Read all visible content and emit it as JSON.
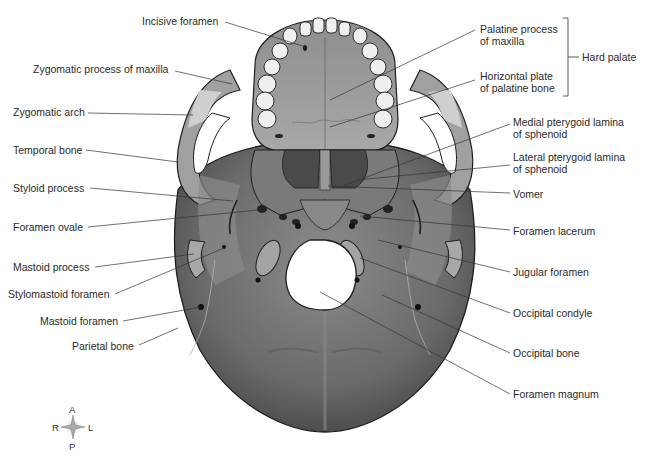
{
  "figure": {
    "view": "inferior"
  },
  "labels_left": [
    {
      "id": "incisive-foramen",
      "text": "Incisive foramen"
    },
    {
      "id": "zygomatic-process-of-maxilla",
      "text": "Zygomatic process of maxilla"
    },
    {
      "id": "zygomatic-arch",
      "text": "Zygomatic arch"
    },
    {
      "id": "temporal-bone",
      "text": "Temporal bone"
    },
    {
      "id": "styloid-process",
      "text": "Styloid process"
    },
    {
      "id": "foramen-ovale",
      "text": "Foramen ovale"
    },
    {
      "id": "mastoid-process",
      "text": "Mastoid process"
    },
    {
      "id": "stylomastoid-foramen",
      "text": "Stylomastoid foramen"
    },
    {
      "id": "mastoid-foramen",
      "text": "Mastoid foramen"
    },
    {
      "id": "parietal-bone",
      "text": "Parietal bone"
    }
  ],
  "labels_right": [
    {
      "id": "palatine-process-of-maxilla",
      "line1": "Palatine process",
      "line2": "of maxilla"
    },
    {
      "id": "horizontal-plate-of-palatine-bone",
      "line1": "Horizontal plate",
      "line2": "of palatine bone"
    },
    {
      "id": "medial-pterygoid-lamina",
      "line1": "Medial pterygoid lamina",
      "line2": "of sphenoid"
    },
    {
      "id": "lateral-pterygoid-lamina",
      "line1": "Lateral pterygoid lamina",
      "line2": "of sphenoid"
    },
    {
      "id": "vomer",
      "text": "Vomer"
    },
    {
      "id": "foramen-lacerum",
      "text": "Foramen lacerum"
    },
    {
      "id": "jugular-foramen",
      "text": "Jugular foramen"
    },
    {
      "id": "occipital-condyle",
      "text": "Occipital condyle"
    },
    {
      "id": "occipital-bone",
      "text": "Occipital bone"
    },
    {
      "id": "foramen-magnum",
      "text": "Foramen magnum"
    }
  ],
  "bracket": {
    "text": "Hard palate"
  },
  "compass": {
    "anterior": "A",
    "posterior": "P",
    "right": "R",
    "left": "L"
  },
  "colors": {
    "bone_dark": "#6e6e6e",
    "bone_mid": "#9a9a9a",
    "bone_light": "#c4c4c4",
    "teeth": "#efefef",
    "outline": "#1e1e1e",
    "leader": "#333333",
    "text": "#2a2a2a"
  }
}
